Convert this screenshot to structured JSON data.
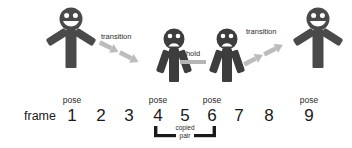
{
  "diagram": {
    "title_text": "",
    "colors": {
      "figure_dark": "#4a4a4a",
      "figure_sad": "#3a3a3a",
      "arrow_gray": "#b8b8b8",
      "hold_bar": "#b5b5b5",
      "bracket": "#1a1a1a",
      "text": "#1a1a1a",
      "background": "#ffffff"
    },
    "row_label": "frame",
    "frames": [
      {
        "number": "1",
        "pose_label": "pose"
      },
      {
        "number": "2",
        "pose_label": ""
      },
      {
        "number": "3",
        "pose_label": ""
      },
      {
        "number": "4",
        "pose_label": "pose"
      },
      {
        "number": "5",
        "pose_label": ""
      },
      {
        "number": "6",
        "pose_label": "pose"
      },
      {
        "number": "7",
        "pose_label": ""
      },
      {
        "number": "8",
        "pose_label": ""
      },
      {
        "number": "9",
        "pose_label": "pose"
      }
    ],
    "characters": [
      {
        "id": "character-frame-1",
        "expression": "happy",
        "arms": "up",
        "frame": "1"
      },
      {
        "id": "character-frame-4",
        "expression": "sad",
        "arms": "down",
        "frame": "4"
      },
      {
        "id": "character-frame-6",
        "expression": "sad",
        "arms": "down",
        "frame": "6"
      },
      {
        "id": "character-frame-9",
        "expression": "happy",
        "arms": "up",
        "frame": "9"
      }
    ],
    "annotations": {
      "transition_left": "transition",
      "transition_right": "transition",
      "hold": "hold",
      "copied_line_1": "copied",
      "copied_line_2": "pair"
    }
  }
}
